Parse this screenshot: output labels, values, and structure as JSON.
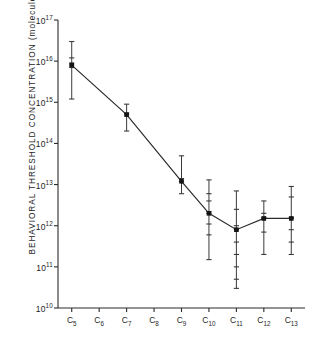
{
  "chart_data": {
    "type": "scatter",
    "title": "",
    "xlabel": "",
    "ylabel": "BEHAVIORAL  THRESHOLD  CONCENTRATION  (molecules/cm³)",
    "ylabel_main": "BEHAVIORAL  THRESHOLD  CONCENTRATION",
    "ylabel_units": "(molecules/cm³)",
    "grid": false,
    "legend": "none",
    "yscale": "log",
    "ylim": [
      10000000000.0,
      1e+17
    ],
    "y_ticks": [
      {
        "value": 10000000000.0,
        "mantissa": "10",
        "exponent": "10"
      },
      {
        "value": 100000000000.0,
        "mantissa": "10",
        "exponent": "11"
      },
      {
        "value": 1000000000000.0,
        "mantissa": "10",
        "exponent": "12"
      },
      {
        "value": 10000000000000.0,
        "mantissa": "10",
        "exponent": "13"
      },
      {
        "value": 100000000000000.0,
        "mantissa": "10",
        "exponent": "14"
      },
      {
        "value": 1000000000000000.0,
        "mantissa": "10",
        "exponent": "15"
      },
      {
        "value": 1e+16,
        "mantissa": "10",
        "exponent": "16"
      },
      {
        "value": 1e+17,
        "mantissa": "10",
        "exponent": "17"
      }
    ],
    "categories": [
      "C5",
      "C6",
      "C7",
      "C8",
      "C9",
      "C10",
      "C11",
      "C12",
      "C13"
    ],
    "x_tick_labels": [
      {
        "base": "C",
        "sub": "5"
      },
      {
        "base": "C",
        "sub": "6"
      },
      {
        "base": "C",
        "sub": "7"
      },
      {
        "base": "C",
        "sub": "8"
      },
      {
        "base": "C",
        "sub": "9"
      },
      {
        "base": "C",
        "sub": "10"
      },
      {
        "base": "C",
        "sub": "11"
      },
      {
        "base": "C",
        "sub": "12"
      },
      {
        "base": "C",
        "sub": "13"
      }
    ],
    "series": [
      {
        "name": "behavioral threshold",
        "connected": true,
        "points": [
          {
            "x": "C5",
            "value": 8000000000000000.0,
            "low": 1200000000000000.0,
            "high": 3e+16,
            "observations": [
              3e+16,
              1.2e+16,
              9000000000000000.0,
              8000000000000000.0,
              7000000000000000.0,
              1200000000000000.0
            ]
          },
          {
            "x": "C6",
            "value": null,
            "low": null,
            "high": null,
            "observations": []
          },
          {
            "x": "C7",
            "value": 500000000000000.0,
            "low": 200000000000000.0,
            "high": 900000000000000.0,
            "observations": [
              900000000000000.0,
              550000000000000.0,
              500000000000000.0,
              200000000000000.0
            ]
          },
          {
            "x": "C8",
            "value": null,
            "low": null,
            "high": null,
            "observations": []
          },
          {
            "x": "C9",
            "value": 12000000000000.0,
            "low": 6000000000000.0,
            "high": 50000000000000.0,
            "observations": [
              50000000000000.0,
              14000000000000.0,
              12000000000000.0,
              6000000000000.0
            ]
          },
          {
            "x": "C10",
            "value": 2000000000000.0,
            "low": 150000000000.0,
            "high": 13000000000000.0,
            "observations": [
              13000000000000.0,
              6000000000000.0,
              4000000000000.0,
              2200000000000.0,
              2000000000000.0,
              1100000000000.0,
              600000000000.0,
              150000000000.0
            ]
          },
          {
            "x": "C11",
            "value": 800000000000.0,
            "low": 30000000000.0,
            "high": 7000000000000.0,
            "observations": [
              7000000000000.0,
              2500000000000.0,
              1000000000000.0,
              800000000000.0,
              400000000000.0,
              200000000000.0,
              100000000000.0,
              50000000000.0,
              30000000000.0
            ]
          },
          {
            "x": "C12",
            "value": 1500000000000.0,
            "low": 200000000000.0,
            "high": 4000000000000.0,
            "observations": [
              4000000000000.0,
              2000000000000.0,
              1600000000000.0,
              1500000000000.0,
              700000000000.0,
              200000000000.0
            ]
          },
          {
            "x": "C13",
            "value": 1500000000000.0,
            "low": 200000000000.0,
            "high": 9000000000000.0,
            "observations": [
              9000000000000.0,
              5000000000000.0,
              1600000000000.0,
              1500000000000.0,
              800000000000.0,
              400000000000.0,
              200000000000.0
            ]
          }
        ]
      }
    ],
    "colors": {
      "axis": "#2a2a2a",
      "line": "#2a2a2a",
      "marker": "#141414",
      "errorbar": "#3a3a3a",
      "background": "#ffffff",
      "text": "#1e1e1e"
    }
  }
}
